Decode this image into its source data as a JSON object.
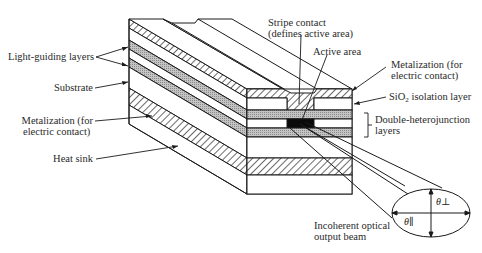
{
  "diagram": {
    "type": "cross-section illustration",
    "colors": {
      "line": "#1a1a1a",
      "background": "#ffffff",
      "gray_layer": "#b8b8b8",
      "active_area": "#0a0a0a"
    }
  },
  "labels": {
    "light_guiding": "Light-guiding layers",
    "substrate": "Substrate",
    "metal_left_1": "Metalization (for",
    "metal_left_2": "electric contact)",
    "heat_sink": "Heat sink",
    "stripe_1": "Stripe contact",
    "stripe_2": "(defines active area)",
    "active_area": "Active area",
    "metal_right_1": "Metalization (for",
    "metal_right_2": "electric contact)",
    "sio2_pre": "SiO",
    "sio2_sub": "2",
    "sio2_post": " isolation layer",
    "dh_1": "Double-heterojunction",
    "dh_2": "layers",
    "beam_1": "Incoherent optical",
    "beam_2": "output beam",
    "theta_perp": "θ⊥",
    "theta_par": "θ∥"
  }
}
